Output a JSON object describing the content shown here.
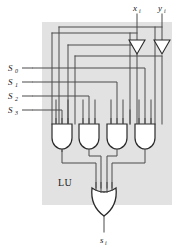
{
  "figure": {
    "panel_label": "LU",
    "panel_color": "#e2e2e2",
    "wire_color": "#4a4a4a",
    "gate_fill": "#ffffff",
    "gate_stroke": "#2b2b2b"
  },
  "inputs": {
    "data": [
      {
        "id": "x",
        "base": "x",
        "sub": "i",
        "x": 137
      },
      {
        "id": "y",
        "base": "y",
        "sub": "i",
        "x": 162
      }
    ],
    "selects": [
      {
        "id": "s0",
        "base": "S",
        "sub": "0",
        "y": 68
      },
      {
        "id": "s1",
        "base": "S",
        "sub": "1",
        "y": 82
      },
      {
        "id": "s2",
        "base": "S",
        "sub": "2",
        "y": 96
      },
      {
        "id": "s3",
        "base": "S",
        "sub": "3",
        "y": 110
      }
    ]
  },
  "output": {
    "id": "s_out",
    "base": "s",
    "sub": "i"
  },
  "gates": {
    "and": [
      {
        "id": "and0",
        "cx": 62,
        "inputs": 3
      },
      {
        "id": "and1",
        "cx": 89,
        "inputs": 3
      },
      {
        "id": "and2",
        "cx": 117,
        "inputs": 3
      },
      {
        "id": "and3",
        "cx": 145,
        "inputs": 3
      }
    ],
    "or": {
      "id": "or0",
      "cx": 104,
      "inputs": 4
    }
  },
  "inverters": [
    {
      "id": "inv_x",
      "cx": 137
    },
    {
      "id": "inv_y",
      "cx": 162
    }
  ]
}
